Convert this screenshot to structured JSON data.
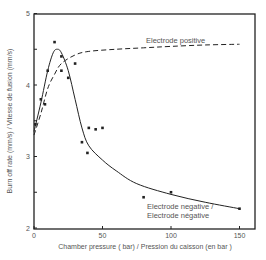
{
  "chart_data": {
    "type": "scatter",
    "title": "",
    "xlabel": "Chamber pressure ( bar) / Pression du caisson (en bar )",
    "ylabel": "Burn off rate (mm/s) / Vitesse de fusion (mm/s)",
    "xlim": [
      0,
      160
    ],
    "ylim": [
      2,
      5
    ],
    "x_ticks": [
      0,
      50,
      100,
      150
    ],
    "x_tick_labels": [
      "0",
      "50",
      "100",
      "150"
    ],
    "y_ticks": [
      2,
      2.5,
      3,
      3.5,
      4,
      4.5,
      5
    ],
    "y_tick_labels": [
      "2",
      "",
      "3",
      "",
      "4",
      "",
      "5"
    ],
    "grid": false,
    "legend": "inline annotations",
    "series": [
      {
        "name": "Electrode negative / Electrode négative",
        "kind": "scatter+fitted-solid-curve",
        "points": [
          {
            "x": 1,
            "y": 3.45
          },
          {
            "x": 5,
            "y": 3.8
          },
          {
            "x": 8,
            "y": 3.73
          },
          {
            "x": 10,
            "y": 4.2
          },
          {
            "x": 15,
            "y": 4.6
          },
          {
            "x": 20,
            "y": 4.4
          },
          {
            "x": 20,
            "y": 4.2
          },
          {
            "x": 25,
            "y": 4.1
          },
          {
            "x": 30,
            "y": 4.3
          },
          {
            "x": 35,
            "y": 3.2
          },
          {
            "x": 39,
            "y": 3.05
          },
          {
            "x": 40,
            "y": 3.4
          },
          {
            "x": 45,
            "y": 3.38
          },
          {
            "x": 50,
            "y": 3.4
          },
          {
            "x": 80,
            "y": 2.43
          },
          {
            "x": 100,
            "y": 2.5
          },
          {
            "x": 150,
            "y": 2.27
          }
        ],
        "curve": [
          {
            "x": 0,
            "y": 3.35
          },
          {
            "x": 5,
            "y": 3.75
          },
          {
            "x": 10,
            "y": 4.2
          },
          {
            "x": 14,
            "y": 4.45
          },
          {
            "x": 17,
            "y": 4.5
          },
          {
            "x": 20,
            "y": 4.45
          },
          {
            "x": 25,
            "y": 4.2
          },
          {
            "x": 30,
            "y": 3.8
          },
          {
            "x": 35,
            "y": 3.4
          },
          {
            "x": 40,
            "y": 3.15
          },
          {
            "x": 50,
            "y": 2.95
          },
          {
            "x": 60,
            "y": 2.8
          },
          {
            "x": 75,
            "y": 2.62
          },
          {
            "x": 100,
            "y": 2.47
          },
          {
            "x": 125,
            "y": 2.36
          },
          {
            "x": 150,
            "y": 2.27
          }
        ],
        "label_lines": [
          "Electrode negative /",
          "Electrode négative"
        ]
      },
      {
        "name": "Electrode positive",
        "kind": "dashed-curve",
        "curve": [
          {
            "x": 0,
            "y": 3.3
          },
          {
            "x": 5,
            "y": 3.6
          },
          {
            "x": 10,
            "y": 3.95
          },
          {
            "x": 15,
            "y": 4.15
          },
          {
            "x": 20,
            "y": 4.3
          },
          {
            "x": 30,
            "y": 4.42
          },
          {
            "x": 40,
            "y": 4.47
          },
          {
            "x": 60,
            "y": 4.5
          },
          {
            "x": 80,
            "y": 4.52
          },
          {
            "x": 100,
            "y": 4.54
          },
          {
            "x": 125,
            "y": 4.56
          },
          {
            "x": 150,
            "y": 4.57
          }
        ],
        "label_lines": [
          "Electrode positive"
        ]
      }
    ]
  },
  "colors": {
    "ink": "#222222",
    "text": "#555555",
    "background": "#ffffff"
  }
}
